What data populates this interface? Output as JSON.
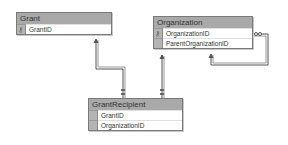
{
  "diagram": {
    "type": "database-schema",
    "tables": [
      {
        "name": "Grant",
        "columns": [
          {
            "name": "GrantID",
            "primary_key": true
          }
        ]
      },
      {
        "name": "Organization",
        "columns": [
          {
            "name": "OrganizationID",
            "primary_key": true
          },
          {
            "name": "ParentOrganizationID",
            "primary_key": false
          }
        ]
      },
      {
        "name": "GrantRecipient",
        "columns": [
          {
            "name": "GrantID",
            "primary_key": false
          },
          {
            "name": "OrganizationID",
            "primary_key": false
          }
        ]
      }
    ],
    "relationships": [
      {
        "from": "GrantRecipient",
        "to": "Grant",
        "label": "GrantID"
      },
      {
        "from": "GrantRecipient",
        "to": "Organization",
        "label": "OrganizationID"
      },
      {
        "from": "Organization",
        "to": "Organization",
        "label": "ParentOrganizationID"
      }
    ],
    "icons": {
      "primary_key": "key-icon"
    }
  }
}
